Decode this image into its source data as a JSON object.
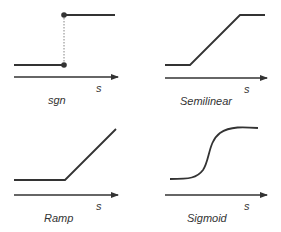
{
  "colors": {
    "curve": "#333333",
    "axis": "#333333",
    "text": "#333333",
    "guide": "#666666"
  },
  "panels": [
    {
      "name": "sgn",
      "label": "sgn",
      "axis_label": "s"
    },
    {
      "name": "semilinear",
      "label": "Semilinear",
      "axis_label": "s"
    },
    {
      "name": "ramp",
      "label": "Ramp",
      "axis_label": "s"
    },
    {
      "name": "sigmoid",
      "label": "Sigmoid",
      "axis_label": "s"
    }
  ]
}
